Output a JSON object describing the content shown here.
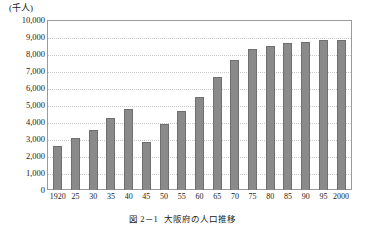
{
  "chart_data": {
    "type": "bar",
    "title": "大阪府の人口推移",
    "figure_number": "図 2－1",
    "xlabel": "",
    "ylabel": "",
    "unit_label": "(千人)",
    "ylim": [
      0,
      10000
    ],
    "yticks": [
      "10,000",
      "9,000",
      "8,000",
      "7,000",
      "6,000",
      "5,000",
      "4,000",
      "3,000",
      "2,000",
      "1,000",
      "0"
    ],
    "ytick_values": [
      10000,
      9000,
      8000,
      7000,
      6000,
      5000,
      4000,
      3000,
      2000,
      1000,
      0
    ],
    "grid": true,
    "legend": "none",
    "categories": [
      "1920",
      "25",
      "30",
      "35",
      "40",
      "45",
      "50",
      "55",
      "60",
      "65",
      "70",
      "75",
      "80",
      "85",
      "90",
      "95",
      "2000"
    ],
    "values": [
      2570,
      3060,
      3540,
      4240,
      4790,
      2800,
      3860,
      4620,
      5500,
      6650,
      7620,
      8280,
      8470,
      8670,
      8730,
      8800,
      8810
    ],
    "series": [
      {
        "name": "大阪府人口",
        "values": [
          2570,
          3060,
          3540,
          4240,
          4790,
          2800,
          3860,
          4620,
          5500,
          6650,
          7620,
          8280,
          8470,
          8670,
          8730,
          8800,
          8810
        ]
      }
    ],
    "bar_color": "#8a8a8a",
    "bar_edge_color": "#6f6f6f",
    "grid_color": "#c9c9c9",
    "frame_color": "#9a9a9a"
  },
  "caption": {
    "number": "図 2－1",
    "text": "大阪府の人口推移"
  }
}
